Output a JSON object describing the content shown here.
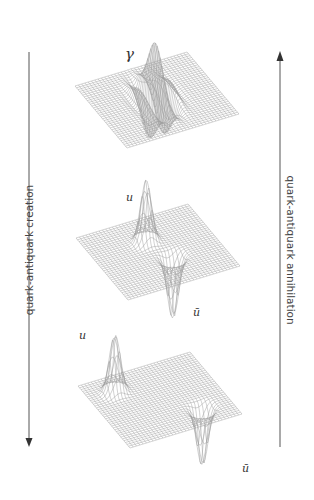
{
  "diagram": {
    "title": "",
    "arrows": [
      {
        "id": "left",
        "direction": "down",
        "label": "quark-antiquark creation"
      },
      {
        "id": "right",
        "direction": "up",
        "label": "quark-antiquark annihilation"
      }
    ],
    "panels": [
      {
        "id": "photon",
        "stage": "top",
        "labels": [
          {
            "text": "γ",
            "role": "photon"
          }
        ],
        "feature": "oscillating wave packet centered on plane"
      },
      {
        "id": "pair-close",
        "stage": "middle",
        "labels": [
          {
            "text": "u",
            "role": "quark"
          },
          {
            "text": "ū",
            "role": "antiquark"
          }
        ],
        "feature": "adjacent peak and trough"
      },
      {
        "id": "pair-apart",
        "stage": "bottom",
        "labels": [
          {
            "text": "u",
            "role": "quark"
          },
          {
            "text": "ū",
            "role": "antiquark"
          }
        ],
        "feature": "separated peak and trough"
      }
    ],
    "colors": {
      "mesh": "#9a9a9a",
      "mesh_dark": "#555555",
      "arrow": "#444444",
      "text": "#333333"
    }
  }
}
